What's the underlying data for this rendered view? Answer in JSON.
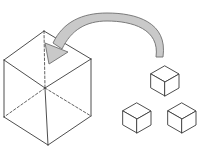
{
  "canvas": {
    "width": 201,
    "height": 150,
    "background": "#ffffff",
    "title": "Cube decomposition diagram"
  },
  "style": {
    "outline_color": "#3a3a3a",
    "solid_stroke_width": 0.9,
    "dashed_stroke_width": 0.8,
    "dash_pattern": "2.5,2",
    "arrow_fill": "#c9c9c9",
    "arrow_stroke": "#6e6e6e",
    "arrow_stroke_width": 0.9,
    "shape_fill": "#ffffff"
  },
  "large_cube": {
    "label": "large-wireframe-cube",
    "vertices": {
      "top": [
        44,
        31
      ],
      "left_upper": [
        4,
        60
      ],
      "right_upper": [
        91,
        59
      ],
      "center": [
        45,
        88
      ],
      "left_lower": [
        4,
        117
      ],
      "right_lower": [
        91,
        116
      ],
      "bottom": [
        48,
        145
      ]
    },
    "visible_edges": [
      [
        [
          44,
          31
        ],
        [
          4,
          60
        ]
      ],
      [
        [
          44,
          31
        ],
        [
          91,
          59
        ]
      ],
      [
        [
          4,
          60
        ],
        [
          45,
          88
        ]
      ],
      [
        [
          91,
          59
        ],
        [
          45,
          88
        ]
      ],
      [
        [
          4,
          60
        ],
        [
          4,
          117
        ]
      ],
      [
        [
          91,
          59
        ],
        [
          91,
          116
        ]
      ],
      [
        [
          4,
          117
        ],
        [
          48,
          145
        ]
      ],
      [
        [
          91,
          116
        ],
        [
          48,
          145
        ]
      ],
      [
        [
          45,
          88
        ],
        [
          48,
          145
        ]
      ]
    ],
    "hidden_edges": [
      [
        [
          44,
          31
        ],
        [
          45,
          88
        ]
      ],
      [
        [
          45,
          88
        ],
        [
          4,
          117
        ]
      ],
      [
        [
          45,
          88
        ],
        [
          91,
          116
        ]
      ]
    ]
  },
  "arrow": {
    "label": "curved-transform-arrow",
    "direction": "right-to-left",
    "description": "thick curved arc sweeping over the top from the small cubes down into the large cube",
    "outer_path": "M 163 57 C 168 22, 136 13, 107 13 C 82 13, 62 22, 52 46",
    "inner_path": "M 156 57 C 160 28, 134 20, 107 20 C 85 20, 69 28, 59 49",
    "head_tip": [
      49,
      64
    ],
    "head_points": "49,64 46,45 66,53",
    "apex": [
      107,
      14
    ]
  },
  "small_cubes": [
    {
      "label": "small-cube-upper-right",
      "vertices": {
        "top": [
          165,
          66
        ],
        "left_upper": [
          151,
          74
        ],
        "right_upper": [
          179,
          74
        ],
        "center": [
          165,
          82
        ],
        "left_lower": [
          151,
          88
        ],
        "right_lower": [
          179,
          88
        ],
        "bottom": [
          165,
          96
        ]
      }
    },
    {
      "label": "small-cube-lower-middle",
      "vertices": {
        "top": [
          137,
          103
        ],
        "left_upper": [
          123,
          111
        ],
        "right_upper": [
          151,
          111
        ],
        "center": [
          137,
          119
        ],
        "left_lower": [
          123,
          125
        ],
        "right_lower": [
          151,
          125
        ],
        "bottom": [
          137,
          133
        ]
      }
    },
    {
      "label": "small-cube-lower-right",
      "vertices": {
        "top": [
          182,
          103
        ],
        "left_upper": [
          168,
          111
        ],
        "right_upper": [
          196,
          111
        ],
        "center": [
          182,
          119
        ],
        "left_lower": [
          168,
          125
        ],
        "right_lower": [
          196,
          125
        ],
        "bottom": [
          182,
          133
        ]
      }
    }
  ]
}
